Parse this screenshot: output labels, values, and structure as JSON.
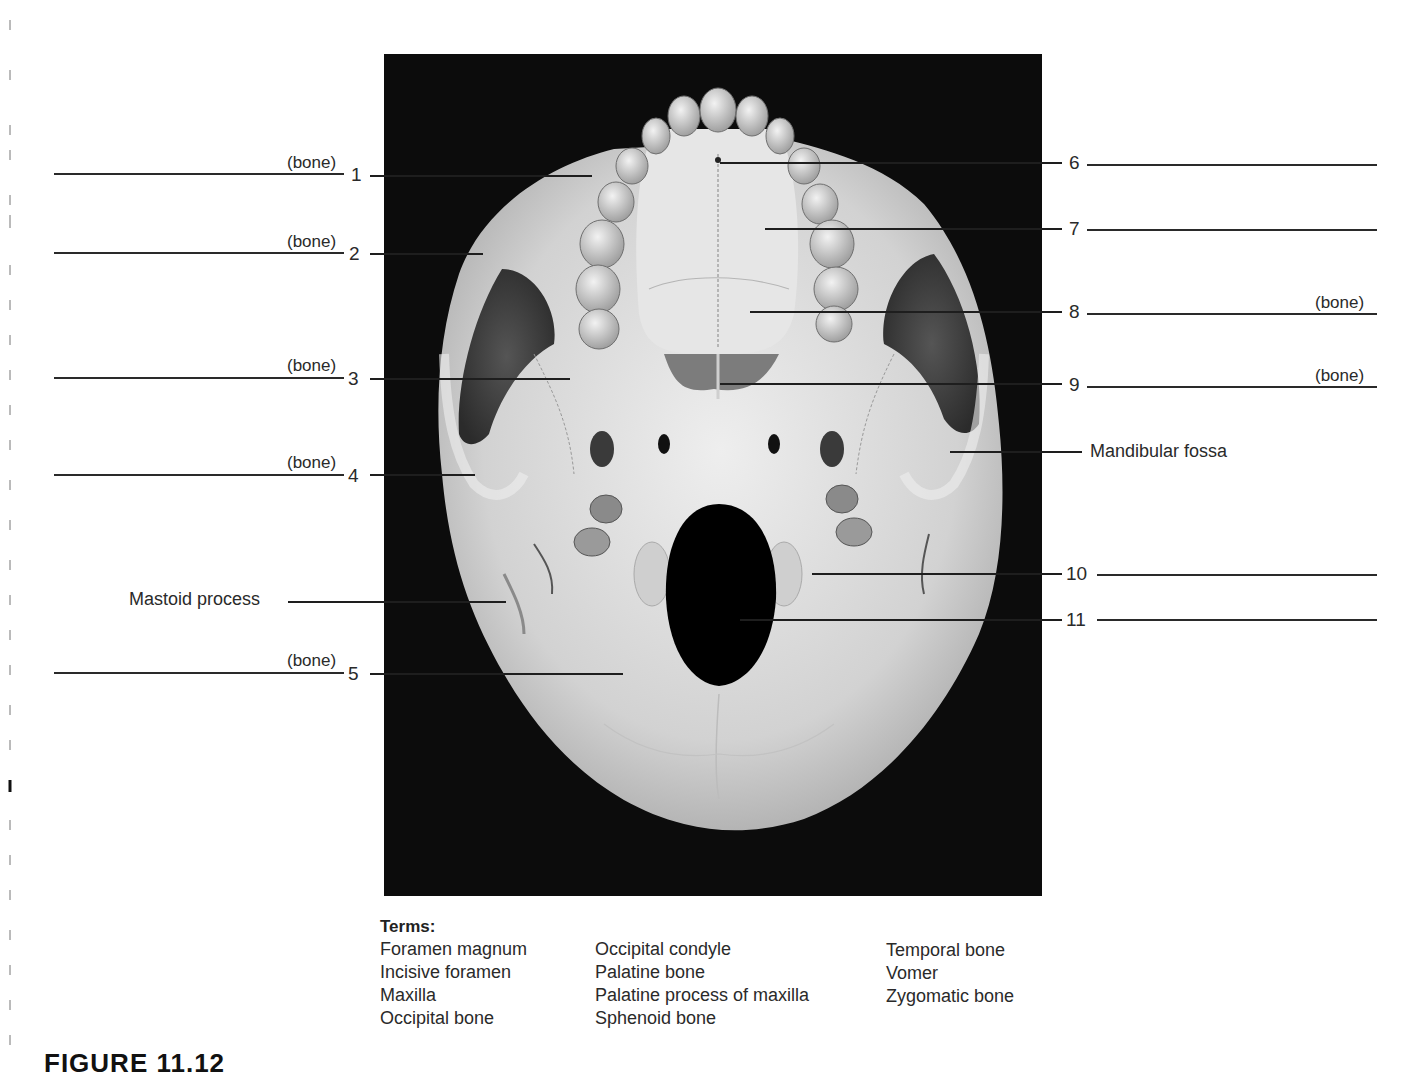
{
  "figure": {
    "photo_description": "Inferior view of human skull",
    "caption_partial": "FIGURE 11.12"
  },
  "left_labels": [
    {
      "number": "1",
      "tag": "(bone)"
    },
    {
      "number": "2",
      "tag": "(bone)"
    },
    {
      "number": "3",
      "tag": "(bone)"
    },
    {
      "number": "4",
      "tag": "(bone)"
    },
    {
      "number": "5",
      "tag": "(bone)"
    }
  ],
  "right_labels": [
    {
      "number": "6",
      "tag": ""
    },
    {
      "number": "7",
      "tag": ""
    },
    {
      "number": "8",
      "tag": "(bone)"
    },
    {
      "number": "9",
      "tag": "(bone)"
    },
    {
      "number": "10",
      "tag": ""
    },
    {
      "number": "11",
      "tag": ""
    }
  ],
  "named_labels": {
    "mastoid_process": "Mastoid process",
    "mandibular_fossa": "Mandibular fossa"
  },
  "terms": {
    "title": "Terms:",
    "columns": [
      [
        "Foramen magnum",
        "Incisive foramen",
        "Maxilla",
        "Occipital bone"
      ],
      [
        "Occipital condyle",
        "Palatine bone",
        "Palatine process of maxilla",
        "Sphenoid bone"
      ],
      [
        "Temporal bone",
        "Vomer",
        "Zygomatic bone"
      ]
    ]
  },
  "colors": {
    "photo_background": "#0c0c0c",
    "bone": "#d9d9d9",
    "line": "#2a2a2a"
  }
}
